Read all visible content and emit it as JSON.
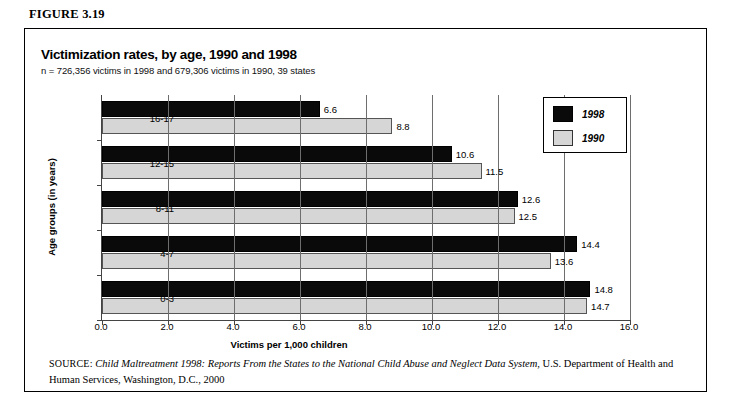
{
  "figure": {
    "label": "FIGURE 3.19"
  },
  "chart": {
    "title": "Victimization rates, by age, 1990 and 1998",
    "subtitle": "n = 726,356 victims in 1998 and 679,306 victims in 1990, 39 states"
  },
  "legend": {
    "items": [
      {
        "label": "1998",
        "color": "#0a0a0a"
      },
      {
        "label": "1990",
        "color": "#d6d6d6"
      }
    ]
  },
  "source": {
    "label": "SOURCE:",
    "title": "Child Maltreatment 1998: Reports From the States to the National Child Abuse and Neglect Data System",
    "rest": ", U.S. Department of Health and Human Services, Washington, D.C., 2000"
  },
  "chart_data": {
    "type": "bar",
    "orientation": "horizontal",
    "title": "Victimization rates, by age, 1990 and 1998",
    "subtitle": "n = 726,356 victims in 1998 and 679,306 victims in 1990, 39 states",
    "xlabel": "Victims per 1,000 children",
    "ylabel": "Age groups (in years)",
    "xlim": [
      0.0,
      16.0
    ],
    "xticks": [
      "0.0",
      "2.0",
      "4.0",
      "6.0",
      "8.0",
      "10.0",
      "12.0",
      "14.0",
      "16.0"
    ],
    "xtick_values": [
      0,
      2,
      4,
      6,
      8,
      10,
      12,
      14,
      16
    ],
    "grid": "vertical",
    "legend_position": "upper-right",
    "categories": [
      "16-17",
      "12-15",
      "8-11",
      "4-7",
      "0-3"
    ],
    "series": [
      {
        "name": "1998",
        "color": "#0a0a0a",
        "values": [
          6.6,
          10.6,
          12.6,
          14.4,
          14.8
        ]
      },
      {
        "name": "1990",
        "color": "#d6d6d6",
        "values": [
          8.8,
          11.5,
          12.5,
          13.6,
          14.7
        ]
      }
    ],
    "value_labels": {
      "1998": [
        "6.6",
        "10.6",
        "12.6",
        "14.4",
        "14.8"
      ],
      "1990": [
        "8.8",
        "11.5",
        "12.5",
        "13.6",
        "14.7"
      ]
    }
  }
}
